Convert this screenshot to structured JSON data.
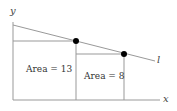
{
  "diagram": {
    "axes": {
      "x_label": "x",
      "y_label": "y"
    },
    "line_label": "l",
    "regions": [
      {
        "label": "Area = 13"
      },
      {
        "label": "Area = 8"
      }
    ],
    "colors": {
      "line": "#888888",
      "point": "#000000"
    }
  }
}
